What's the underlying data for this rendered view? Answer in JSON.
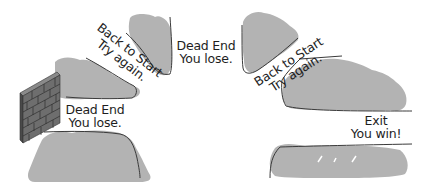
{
  "colors": {
    "hedge": "#b3b3b3",
    "outline": "#3a3a3a",
    "brick": "#6e6e6e",
    "brick_dark": "#454545",
    "mortar": "#d4d4d4",
    "background": "#ffffff",
    "text": "#1e1e1e"
  },
  "labels": {
    "dead_end_left": {
      "line1": "Dead End",
      "line2": "You lose."
    },
    "back_to_start_left": {
      "line1": "Back to Start",
      "line2": "Try again."
    },
    "dead_end_top": {
      "line1": "Dead End",
      "line2": "You lose."
    },
    "back_to_start_right": {
      "line1": "Back to Start",
      "line2": "Try again."
    },
    "exit": {
      "line1": "Exit",
      "line2": "You win!"
    }
  },
  "icons": {
    "brick_wall": "brick-wall-icon"
  }
}
